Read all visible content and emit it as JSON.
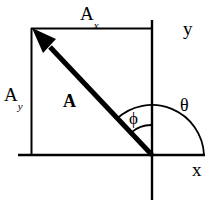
{
  "diagram": {
    "type": "vector-decomposition-diagram",
    "background_color": "#ffffff",
    "stroke_color": "#000000",
    "labels": {
      "component_x": {
        "base": "A",
        "subscript": "x"
      },
      "component_y": {
        "base": "A",
        "subscript": "y"
      },
      "vector": "A",
      "axis_y": "y",
      "axis_x": "x",
      "angle_inner": "ϕ",
      "angle_outer": "θ"
    },
    "geometry": {
      "origin": {
        "x": 152,
        "y": 155
      },
      "vector_tip": {
        "x": 33,
        "y": 30
      },
      "x_axis": {
        "x1": 18,
        "y1": 155,
        "x2": 205,
        "y2": 155
      },
      "y_axis": {
        "x1": 152,
        "y1": 20,
        "x2": 152,
        "y2": 200
      },
      "component_rect": {
        "left": 31,
        "top": 28,
        "right": 152,
        "bottom": 155
      },
      "arc_phi_radius": 30,
      "arc_theta_radius": 52,
      "arrow_head_length": 24,
      "line_width_axis": 2,
      "line_width_vector": 5
    }
  }
}
